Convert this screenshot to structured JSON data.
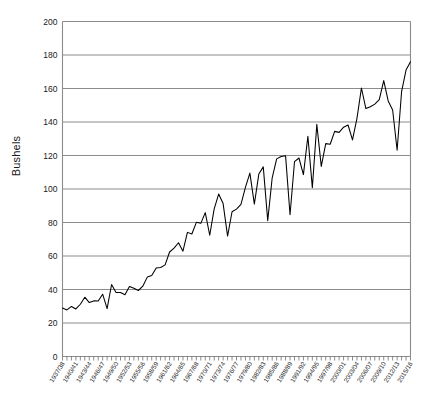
{
  "chart_data": {
    "type": "line",
    "title": "",
    "subtitle": "",
    "xlabel": "",
    "ylabel": "Bushels",
    "ylim": [
      0,
      200
    ],
    "ytick_step": 20,
    "yticks": [
      0,
      20,
      40,
      60,
      80,
      100,
      120,
      140,
      160,
      180,
      200
    ],
    "grid": "horizontal",
    "legend": "none",
    "x": [
      "1937/38",
      "1938/39",
      "1939/40",
      "1940/41",
      "1941/42",
      "1942/43",
      "1943/44",
      "1944/45",
      "1945/46",
      "1946/47",
      "1947/48",
      "1948/49",
      "1949/50",
      "1950/51",
      "1951/52",
      "1952/53",
      "1953/54",
      "1954/55",
      "1955/56",
      "1956/57",
      "1957/58",
      "1958/59",
      "1959/60",
      "1960/61",
      "1961/62",
      "1962/63",
      "1963/64",
      "1964/65",
      "1965/66",
      "1966/67",
      "1967/68",
      "1968/69",
      "1969/70",
      "1970/71",
      "1971/72",
      "1972/73",
      "1973/74",
      "1974/75",
      "1975/76",
      "1976/77",
      "1977/78",
      "1978/79",
      "1979/80",
      "1980/81",
      "1981/82",
      "1982/83",
      "1983/84",
      "1984/85",
      "1985/86",
      "1986/87",
      "1987/88",
      "1988/89",
      "1989/90",
      "1990/91",
      "1991/92",
      "1992/93",
      "1993/94",
      "1994/95",
      "1995/96",
      "1996/97",
      "1997/98",
      "1998/99",
      "1999/00",
      "2000/01",
      "2001/02",
      "2002/03",
      "2003/04",
      "2004/05",
      "2005/06",
      "2006/07",
      "2007/08",
      "2008/09",
      "2009/10",
      "2010/11",
      "2011/12",
      "2012/13",
      "2013/14",
      "2014/15",
      "2015/16"
    ],
    "xtick_labels": [
      "1937/38",
      "1940/41",
      "1943/44",
      "1946/47",
      "1949/50",
      "1952/53",
      "1955/56",
      "1958/59",
      "1961/62",
      "1964/65",
      "1967/68",
      "1970/71",
      "1973/74",
      "1976/77",
      "1979/80",
      "1982/83",
      "1985/86",
      "1988/89",
      "1991/92",
      "1994/95",
      "1997/98",
      "2000/01",
      "2003/04",
      "2006/07",
      "2009/10",
      "2012/13",
      "2015/16"
    ],
    "xtick_every": 3,
    "series": [
      {
        "name": "Yield",
        "units": "Bushels",
        "color": "#000000",
        "values": [
          28.9,
          27.8,
          29.9,
          28.4,
          31.2,
          35.4,
          32.2,
          33.2,
          33.1,
          37.2,
          28.6,
          43.0,
          38.2,
          38.2,
          36.9,
          41.8,
          40.7,
          39.4,
          42.0,
          47.4,
          48.3,
          52.8,
          53.1,
          54.7,
          62.4,
          64.7,
          67.9,
          62.9,
          74.1,
          73.1,
          80.1,
          79.5,
          85.9,
          72.4,
          88.1,
          97.0,
          91.3,
          71.9,
          86.4,
          88.0,
          90.8,
          101.0,
          109.5,
          91.0,
          108.9,
          113.2,
          81.1,
          106.7,
          118.0,
          119.4,
          119.8,
          84.6,
          116.3,
          118.5,
          108.6,
          131.5,
          100.7,
          138.6,
          113.5,
          127.1,
          126.7,
          134.4,
          133.8,
          136.9,
          138.2,
          129.3,
          142.2,
          160.3,
          148.0,
          149.1,
          150.7,
          153.3,
          164.7,
          152.6,
          147.2,
          123.1,
          158.1,
          171.0,
          176.0
        ]
      }
    ]
  },
  "axis": {
    "y_title": "Bushels"
  }
}
